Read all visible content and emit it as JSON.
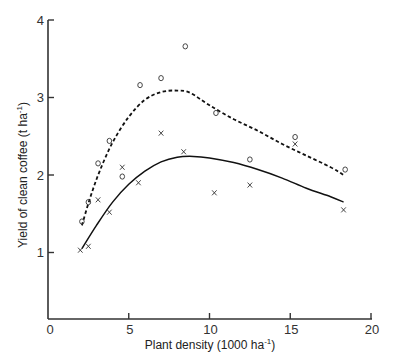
{
  "chart_data": {
    "type": "scatter",
    "title": "",
    "xlabel": "Plant density (1000 ha",
    "xlabel_sup": "-1",
    "xlabel_end": ")",
    "ylabel": "Yield of clean coffee (t ha",
    "ylabel_sup": "-1",
    "ylabel_end": ")",
    "xlim": [
      0,
      20
    ],
    "ylim": [
      0,
      4
    ],
    "xticks": [
      0,
      5,
      10,
      15,
      20
    ],
    "yticks": [
      1,
      2,
      3,
      4
    ],
    "grid": false,
    "legend": "none",
    "series": [
      {
        "name": "o",
        "marker": "circle",
        "points": [
          [
            2.1,
            1.4
          ],
          [
            2.5,
            1.65
          ],
          [
            3.1,
            2.15
          ],
          [
            3.8,
            2.44
          ],
          [
            4.6,
            1.98
          ],
          [
            5.7,
            3.16
          ],
          [
            7.0,
            3.25
          ],
          [
            8.5,
            3.66
          ],
          [
            10.4,
            2.8
          ],
          [
            12.5,
            2.2
          ],
          [
            15.3,
            2.49
          ],
          [
            18.4,
            2.07
          ]
        ],
        "fit_line": {
          "style": "dashed",
          "points": [
            [
              2.1,
              1.35
            ],
            [
              2.6,
              1.7
            ],
            [
              3.2,
              2.05
            ],
            [
              4.0,
              2.42
            ],
            [
              5.0,
              2.75
            ],
            [
              6.0,
              2.97
            ],
            [
              7.0,
              3.07
            ],
            [
              8.0,
              3.09
            ],
            [
              8.8,
              3.06
            ],
            [
              10.0,
              2.9
            ],
            [
              11.5,
              2.72
            ],
            [
              13.0,
              2.57
            ],
            [
              14.5,
              2.4
            ],
            [
              16.0,
              2.25
            ],
            [
              17.5,
              2.1
            ],
            [
              18.3,
              2.0
            ]
          ]
        }
      },
      {
        "name": "x",
        "marker": "cross",
        "points": [
          [
            2.0,
            1.03
          ],
          [
            2.5,
            1.08
          ],
          [
            3.1,
            1.68
          ],
          [
            3.8,
            1.52
          ],
          [
            4.6,
            2.1
          ],
          [
            5.6,
            1.9
          ],
          [
            7.0,
            2.54
          ],
          [
            8.4,
            2.3
          ],
          [
            10.3,
            1.77
          ],
          [
            12.5,
            1.87
          ],
          [
            15.3,
            2.4
          ],
          [
            18.3,
            1.55
          ]
        ],
        "fit_line": {
          "style": "solid",
          "points": [
            [
              2.1,
              1.05
            ],
            [
              3.0,
              1.35
            ],
            [
              4.0,
              1.65
            ],
            [
              5.0,
              1.88
            ],
            [
              6.0,
              2.05
            ],
            [
              7.0,
              2.17
            ],
            [
              8.0,
              2.23
            ],
            [
              9.0,
              2.24
            ],
            [
              10.0,
              2.22
            ],
            [
              11.5,
              2.16
            ],
            [
              13.0,
              2.07
            ],
            [
              14.5,
              1.96
            ],
            [
              16.0,
              1.83
            ],
            [
              17.5,
              1.72
            ],
            [
              18.3,
              1.65
            ]
          ]
        }
      }
    ]
  }
}
